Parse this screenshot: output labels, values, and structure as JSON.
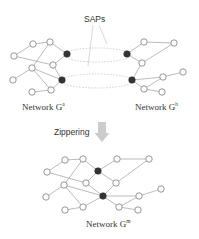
{
  "diagram": {
    "sap_label": "SAPs",
    "network_a_label": "Network G",
    "network_a_sup": "a",
    "network_b_label": "Network G",
    "network_b_sup": "b",
    "zippering_label": "Zippering",
    "network_m_label": "Network G",
    "network_m_sup": "m",
    "colors": {
      "node_fill": "#ffffff",
      "node_stroke": "#8a8a8a",
      "sap_fill": "#333333",
      "edge": "#a9a9a9",
      "arrow": "#c8c8c8"
    }
  }
}
